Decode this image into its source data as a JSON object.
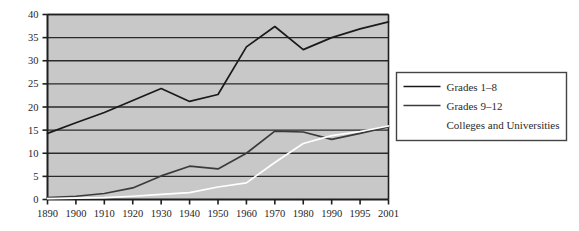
{
  "chart_data": {
    "type": "line",
    "title": "",
    "subtitle": "",
    "xlabel": "",
    "ylabel": "",
    "grid": "horizontal",
    "legend_position": "right",
    "ylim": [
      0,
      40
    ],
    "yticks": [
      0,
      5,
      10,
      15,
      20,
      25,
      30,
      35,
      40
    ],
    "ytick_labels": [
      "0",
      "5",
      "10",
      "15",
      "20",
      "25",
      "30",
      "35",
      "40"
    ],
    "categories": [
      "1890",
      "1900",
      "1910",
      "1920",
      "1930",
      "1940",
      "1950",
      "1960",
      "1970",
      "1980",
      "1990",
      "1995",
      "2001"
    ],
    "x": [
      1890,
      1900,
      1910,
      1920,
      1930,
      1940,
      1950,
      1960,
      1970,
      1980,
      1990,
      1995,
      2001
    ],
    "series": [
      {
        "name": "Grades 1–8",
        "color": "#1a1a1a",
        "values": [
          14.3,
          16.6,
          18.8,
          21.4,
          24.0,
          21.2,
          22.7,
          33.0,
          37.4,
          32.4,
          35.0,
          36.9,
          38.4
        ]
      },
      {
        "name": "Grades 9–12",
        "color": "#3b3b3b",
        "values": [
          0.4,
          0.7,
          1.3,
          2.5,
          5.1,
          7.2,
          6.6,
          10.0,
          14.8,
          14.6,
          13.0,
          14.3,
          15.7
        ]
      },
      {
        "name": "Colleges and Universities",
        "color": "#ffffff",
        "values": [
          0.2,
          0.3,
          0.4,
          0.7,
          1.1,
          1.5,
          2.7,
          3.6,
          8.0,
          12.1,
          13.8,
          14.7,
          15.9
        ]
      }
    ]
  },
  "legend": {
    "entries": [
      {
        "label": "Grades 1–8",
        "swatch": "dark"
      },
      {
        "label": "Grades 9–12",
        "swatch": "dark"
      },
      {
        "label": "Colleges and Universities",
        "swatch": "white"
      }
    ]
  },
  "style": {
    "plot_background": "#c8c8c8",
    "gridline_color": "#2a2a2a",
    "axis_color": "#1f1f1f",
    "page_background": "#ffffff",
    "legend_border": "#444444"
  }
}
